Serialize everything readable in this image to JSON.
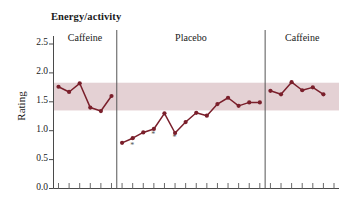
{
  "chart_data": {
    "type": "line",
    "title": "Energy/activity",
    "xlabel": "",
    "ylabel": "Rating",
    "ylim": [
      0.0,
      2.5
    ],
    "yticks": [
      "0.0",
      "0.5",
      "1.0",
      "1.5",
      "2.0",
      "2.5"
    ],
    "ytick_values": [
      0.0,
      0.5,
      1.0,
      1.5,
      2.0,
      2.5
    ],
    "grid": false,
    "legend": "none",
    "xtick_labels": [],
    "n_points": 27,
    "phases": [
      {
        "label": "Caffeine",
        "start_index": 0,
        "end_index": 5,
        "n": 6
      },
      {
        "label": "Placebo",
        "start_index": 6,
        "end_index": 19,
        "n": 14
      },
      {
        "label": "Caffeine",
        "start_index": 20,
        "end_index": 26,
        "n": 7
      }
    ],
    "series": [
      {
        "name": "Rating",
        "color": "#7a1f2b",
        "values": [
          1.76,
          1.67,
          1.82,
          1.4,
          1.34,
          1.6,
          0.79,
          0.87,
          0.97,
          1.03,
          1.3,
          0.96,
          1.15,
          1.31,
          1.26,
          1.46,
          1.57,
          1.43,
          1.49,
          1.49,
          1.69,
          1.63,
          1.84,
          1.7,
          1.75,
          1.63
        ]
      }
    ],
    "reference_band": {
      "label": "normal range band",
      "y_low": 1.35,
      "y_high": 1.83,
      "color": "#d9bfc4"
    },
    "annotations": [
      {
        "symbol": "*",
        "at_index": 7,
        "y": 0.72
      },
      {
        "symbol": "*",
        "at_index": 9,
        "y": 0.9
      },
      {
        "symbol": "*",
        "at_index": 11,
        "y": 0.85
      }
    ],
    "dividers": [
      {
        "after_index": 5
      },
      {
        "after_index": 19
      }
    ]
  },
  "axis": {
    "y_axis_name": "y-axis",
    "x_axis_name": "x-axis"
  }
}
